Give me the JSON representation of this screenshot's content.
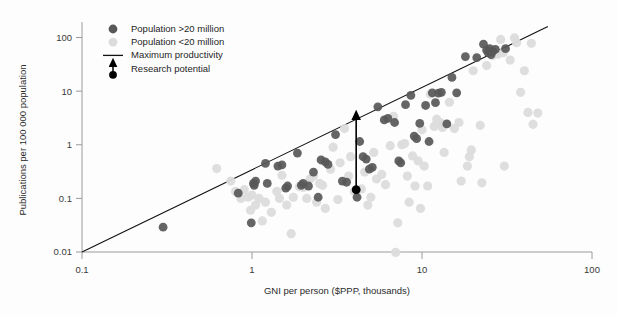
{
  "chart_data": {
    "type": "scatter",
    "title": "",
    "xlabel": "GNI per person ($PPP, thousands)",
    "ylabel": "Publications per 100 000 population",
    "xscale": "log",
    "yscale": "log",
    "xlim": [
      0.1,
      100
    ],
    "ylim": [
      0.01,
      200
    ],
    "xticks": [
      0.1,
      1,
      10,
      100
    ],
    "xtick_labels": [
      "0.1",
      "1",
      "10",
      "100"
    ],
    "yticks": [
      0.01,
      0.1,
      1,
      10,
      100
    ],
    "ytick_labels": [
      "0.01",
      "0.1",
      "1",
      "10",
      "100"
    ],
    "grid": false,
    "legend_position": "top-left",
    "legend": [
      {
        "label": "Population >20 million",
        "marker": "circle",
        "color": "#585858"
      },
      {
        "label": "Population <20 million",
        "marker": "circle",
        "color": "#dcdcdc"
      },
      {
        "label": "Maximum productivity",
        "marker": "line",
        "color": "#111111"
      },
      {
        "label": "Research potential",
        "marker": "arrow",
        "color": "#000000"
      }
    ],
    "annotations": [
      {
        "name": "research-potential-arrow",
        "x": 4.1,
        "y_from": 0.145,
        "y_to": 3.6,
        "label": "Research potential"
      }
    ],
    "reference_line": {
      "name": "Maximum productivity",
      "x_from": 0.1,
      "y_from": 0.01,
      "x_to": 55,
      "y_to": 160
    },
    "series": [
      {
        "name": "Population >20 million",
        "color": "#585858",
        "points": [
          [
            0.3,
            0.029
          ],
          [
            0.83,
            0.125
          ],
          [
            0.99,
            0.035
          ],
          [
            1.02,
            0.19
          ],
          [
            1.03,
            0.175
          ],
          [
            1.05,
            0.21
          ],
          [
            1.2,
            0.45
          ],
          [
            1.23,
            0.19
          ],
          [
            1.42,
            0.4
          ],
          [
            1.5,
            0.42
          ],
          [
            1.58,
            0.155
          ],
          [
            1.62,
            0.17
          ],
          [
            1.85,
            0.7
          ],
          [
            1.95,
            0.175
          ],
          [
            2.0,
            0.19
          ],
          [
            2.15,
            0.17
          ],
          [
            2.3,
            0.31
          ],
          [
            2.45,
            0.105
          ],
          [
            2.55,
            0.52
          ],
          [
            2.7,
            0.48
          ],
          [
            2.8,
            0.43
          ],
          [
            3.1,
            1.55
          ],
          [
            3.4,
            0.21
          ],
          [
            3.6,
            0.2
          ],
          [
            4.1,
            0.145
          ],
          [
            4.15,
            0.105
          ],
          [
            4.3,
            1.15
          ],
          [
            4.5,
            0.6
          ],
          [
            4.7,
            0.54
          ],
          [
            4.9,
            0.35
          ],
          [
            5.1,
            0.38
          ],
          [
            5.5,
            5.1
          ],
          [
            6.0,
            2.9
          ],
          [
            6.3,
            3.1
          ],
          [
            6.9,
            2.6
          ],
          [
            7.3,
            0.5
          ],
          [
            7.5,
            0.46
          ],
          [
            8.0,
            5.6
          ],
          [
            8.6,
            8.3
          ],
          [
            9.0,
            1.45
          ],
          [
            9.3,
            1.3
          ],
          [
            9.7,
            2.5
          ],
          [
            10.5,
            5.4
          ],
          [
            11.0,
            1.15
          ],
          [
            11.5,
            9.3
          ],
          [
            12.0,
            6.1
          ],
          [
            12.5,
            9.2
          ],
          [
            13.0,
            9.5
          ],
          [
            14.0,
            2.45
          ],
          [
            15.0,
            18.0
          ],
          [
            16.0,
            9.3
          ],
          [
            18.0,
            44.0
          ],
          [
            21.0,
            42.0
          ],
          [
            23.0,
            75.0
          ],
          [
            24.0,
            58.0
          ],
          [
            24.5,
            52.0
          ],
          [
            25.0,
            62.0
          ],
          [
            25.5,
            48.0
          ],
          [
            26.0,
            55.0
          ],
          [
            27.0,
            60.0
          ],
          [
            31.0,
            62.0
          ]
        ]
      },
      {
        "name": "Population <20 million",
        "color": "#dcdcdc",
        "points": [
          [
            0.62,
            0.36
          ],
          [
            0.75,
            0.21
          ],
          [
            0.8,
            0.135
          ],
          [
            0.86,
            0.1
          ],
          [
            0.9,
            0.145
          ],
          [
            0.95,
            0.105
          ],
          [
            0.98,
            0.06
          ],
          [
            1.0,
            0.115
          ],
          [
            1.05,
            0.075
          ],
          [
            1.1,
            0.1
          ],
          [
            1.15,
            0.038
          ],
          [
            1.2,
            0.085
          ],
          [
            1.3,
            0.055
          ],
          [
            1.4,
            0.135
          ],
          [
            1.45,
            0.1
          ],
          [
            1.5,
            0.27
          ],
          [
            1.6,
            0.075
          ],
          [
            1.7,
            0.022
          ],
          [
            1.75,
            0.105
          ],
          [
            1.9,
            0.165
          ],
          [
            2.0,
            0.16
          ],
          [
            2.1,
            0.1
          ],
          [
            2.2,
            0.23
          ],
          [
            2.3,
            0.26
          ],
          [
            2.4,
            0.085
          ],
          [
            2.5,
            0.19
          ],
          [
            2.6,
            0.175
          ],
          [
            2.7,
            0.065
          ],
          [
            2.9,
            0.35
          ],
          [
            3.0,
            0.9
          ],
          [
            3.2,
            0.095
          ],
          [
            3.3,
            0.46
          ],
          [
            3.5,
            2.0
          ],
          [
            3.7,
            0.26
          ],
          [
            3.8,
            0.6
          ],
          [
            4.0,
            0.135
          ],
          [
            4.4,
            0.15
          ],
          [
            4.6,
            0.31
          ],
          [
            4.8,
            0.075
          ],
          [
            5.0,
            0.105
          ],
          [
            5.2,
            0.72
          ],
          [
            5.4,
            0.23
          ],
          [
            5.8,
            0.28
          ],
          [
            6.1,
            0.18
          ],
          [
            6.5,
            0.96
          ],
          [
            6.8,
            3.4
          ],
          [
            7.0,
            0.0098
          ],
          [
            7.2,
            0.035
          ],
          [
            7.6,
            1.0
          ],
          [
            7.9,
            1.05
          ],
          [
            8.2,
            0.26
          ],
          [
            8.4,
            0.085
          ],
          [
            8.8,
            0.62
          ],
          [
            9.1,
            0.17
          ],
          [
            9.5,
            0.5
          ],
          [
            9.8,
            0.065
          ],
          [
            10.0,
            1.9
          ],
          [
            10.3,
            0.4
          ],
          [
            10.8,
            0.17
          ],
          [
            11.2,
            8.8
          ],
          [
            11.8,
            2.2
          ],
          [
            12.2,
            3.0
          ],
          [
            12.8,
            2.6
          ],
          [
            13.2,
            2.1
          ],
          [
            13.5,
            0.72
          ],
          [
            14.5,
            6.2
          ],
          [
            15.5,
            2.0
          ],
          [
            16.5,
            2.6
          ],
          [
            17.0,
            0.21
          ],
          [
            18.5,
            0.4
          ],
          [
            19.0,
            0.6
          ],
          [
            20.0,
            24.0
          ],
          [
            22.0,
            2.3
          ],
          [
            24.0,
            30.0
          ],
          [
            26.0,
            46.0
          ],
          [
            28.0,
            49.0
          ],
          [
            30.0,
            52.0
          ],
          [
            33.0,
            38.0
          ],
          [
            36.0,
            80.0
          ],
          [
            38.0,
            9.5
          ],
          [
            40.0,
            24.0
          ],
          [
            42.0,
            4.0
          ],
          [
            45.0,
            2.4
          ],
          [
            48.0,
            3.9
          ],
          [
            22.5,
            0.195
          ],
          [
            30.5,
            0.4
          ],
          [
            19.5,
            0.8
          ],
          [
            35.0,
            98.0
          ],
          [
            29.0,
            92.0
          ],
          [
            44.0,
            78.0
          ]
        ]
      }
    ]
  }
}
